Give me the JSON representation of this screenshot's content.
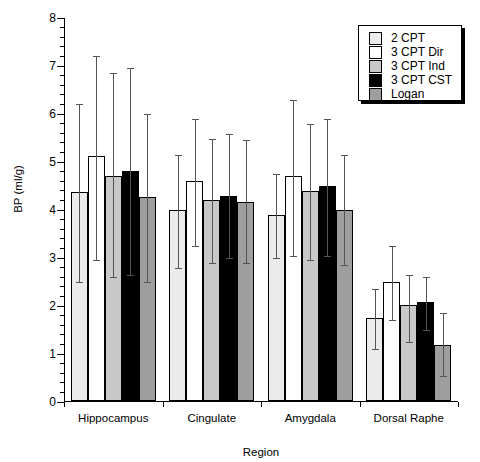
{
  "chart_data": {
    "type": "bar",
    "title": "",
    "xlabel": "Region",
    "ylabel": "BP (ml/g)",
    "ylim": [
      0,
      8
    ],
    "ytick_labels": [
      "0",
      "1",
      "2",
      "3",
      "4",
      "5",
      "6",
      "7",
      "8"
    ],
    "grid": false,
    "legend_position": "top-right",
    "categories": [
      "Hippocampus",
      "Cingulate",
      "Amygdala",
      "Dorsal Raphe"
    ],
    "series": [
      {
        "name": "2 CPT",
        "color": "#ebebeb",
        "values": [
          4.35,
          3.98,
          3.88,
          1.72
        ],
        "err_low": [
          2.5,
          2.8,
          3.0,
          1.1
        ],
        "err_high": [
          6.2,
          5.15,
          4.75,
          2.35
        ]
      },
      {
        "name": "3 CPT Dir",
        "color": "#ffffff",
        "values": [
          5.1,
          4.58,
          4.68,
          2.48
        ],
        "err_low": [
          2.95,
          3.25,
          3.05,
          1.7
        ],
        "err_high": [
          7.2,
          5.9,
          6.3,
          3.25
        ]
      },
      {
        "name": "3 CPT Ind",
        "color": "#c8c8c8",
        "values": [
          4.68,
          4.18,
          4.38,
          2.0
        ],
        "err_low": [
          2.6,
          2.9,
          2.95,
          1.25
        ],
        "err_high": [
          6.85,
          5.48,
          5.8,
          2.65
        ]
      },
      {
        "name": "3 CPT CST",
        "color": "#000000",
        "values": [
          4.8,
          4.28,
          4.48,
          2.07
        ],
        "err_low": [
          2.65,
          3.0,
          3.05,
          1.5
        ],
        "err_high": [
          6.95,
          5.58,
          5.9,
          2.6
        ]
      },
      {
        "name": "Logan",
        "color": "#9e9e9e",
        "values": [
          4.25,
          4.15,
          3.98,
          1.17
        ],
        "err_low": [
          2.5,
          2.9,
          2.85,
          0.55
        ],
        "err_high": [
          6.0,
          5.45,
          5.15,
          1.85
        ]
      }
    ]
  }
}
